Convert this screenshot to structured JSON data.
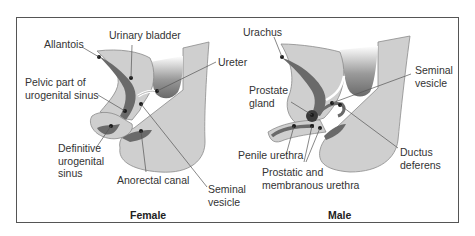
{
  "colors": {
    "tissue_light": "#cfcfcf",
    "tissue_outline": "#8a8a8a",
    "lumen_dark": "#6a6a6a",
    "dot": "#1a1a1a",
    "leader": "#555555",
    "frame": "#555555",
    "text": "#333333"
  },
  "panels": [
    {
      "caption": "Female",
      "labels": [
        {
          "id": "allantois",
          "text": "Allantois"
        },
        {
          "id": "urinary-bladder",
          "text": "Urinary bladder"
        },
        {
          "id": "ureter",
          "text": "Ureter"
        },
        {
          "id": "pelvic-part",
          "text": "Pelvic part of\nurogenital sinus",
          "line1": "Pelvic part of",
          "line2": "urogenital sinus"
        },
        {
          "id": "definitive-sinus",
          "text": "Definitive\nurogenital\nsinus",
          "line1": "Definitive",
          "line2": "urogenital",
          "line3": "sinus"
        },
        {
          "id": "anorectal-canal",
          "text": "Anorectal canal"
        },
        {
          "id": "seminal-vesicle",
          "text": "Seminal\nvesicle",
          "line1": "Seminal",
          "line2": "vesicle"
        }
      ]
    },
    {
      "caption": "Male",
      "labels": [
        {
          "id": "urachus",
          "text": "Urachus"
        },
        {
          "id": "seminal-vesicle",
          "text": "Seminal\nvesicle",
          "line1": "Seminal",
          "line2": "vesicle"
        },
        {
          "id": "prostate-gland",
          "text": "Prostate\ngland",
          "line1": "Prostate",
          "line2": "gland"
        },
        {
          "id": "penile-urethra",
          "text": "Penile urethra"
        },
        {
          "id": "ductus-deferens",
          "text": "Ductus\ndeferens",
          "line1": "Ductus",
          "line2": "deferens"
        },
        {
          "id": "prostatic-membranous",
          "text": "Prostatic and\nmembranous urethra",
          "line1": "Prostatic and",
          "line2": "membranous urethra"
        }
      ]
    }
  ]
}
